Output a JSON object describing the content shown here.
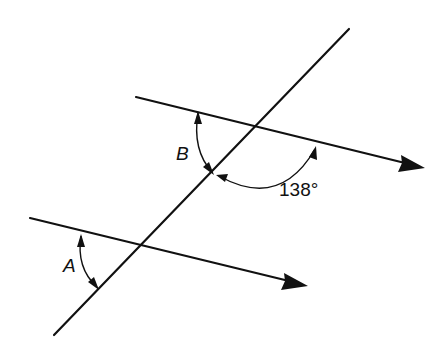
{
  "diagram": {
    "type": "parallel-lines-transversal",
    "stroke_color": "#111111",
    "transversal": {
      "x1": 349,
      "y1": 29,
      "x2": 54,
      "y2": 335
    },
    "upper_line": {
      "x1": 136,
      "y1": 97,
      "x2": 425,
      "y2": 168,
      "has_arrow": true
    },
    "lower_line": {
      "x1": 30,
      "y1": 218,
      "x2": 308,
      "y2": 286,
      "has_arrow": true
    },
    "angles": [
      {
        "label": "B",
        "italic": true,
        "position": "upper line, left of transversal, below line"
      },
      {
        "label": "138°",
        "italic": false,
        "position": "upper line, right of transversal, below line"
      },
      {
        "label": "A",
        "italic": true,
        "position": "lower line, left of transversal, below line"
      }
    ]
  },
  "labels": {
    "angle_b": "B",
    "angle_138": "138°",
    "angle_a": "A"
  }
}
